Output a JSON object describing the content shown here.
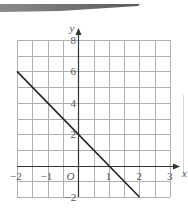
{
  "chart_data": {
    "type": "line",
    "title": "",
    "xlabel": "x",
    "ylabel": "y",
    "origin_label": "O",
    "xlim": [
      -2,
      3
    ],
    "ylim": [
      -2,
      8
    ],
    "grid": true,
    "grid_step": {
      "x": 0.5,
      "y": 1
    },
    "x_ticks": [
      "-2",
      "-1",
      "1",
      "2",
      "3"
    ],
    "y_ticks": [
      "-2",
      "2",
      "4",
      "6",
      "8"
    ],
    "series": [
      {
        "name": "y = -2x + 2",
        "x": [
          -2,
          2
        ],
        "y": [
          6,
          -2
        ],
        "color": "#222222"
      }
    ]
  },
  "colors": {
    "grid": "#b0b0b0",
    "axis": "#333333",
    "line": "#222222",
    "band": "#6a6a6a"
  }
}
